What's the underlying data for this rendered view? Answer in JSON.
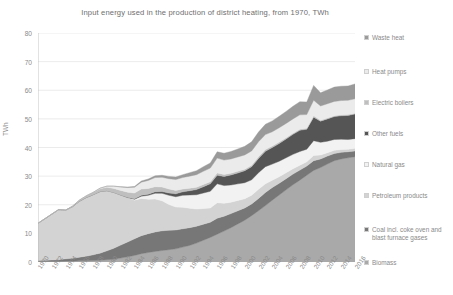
{
  "chart_data": {
    "type": "area",
    "stacked": true,
    "title": "Input energy used in the production of district heating, from 1970, TWh",
    "xlabel": "",
    "ylabel": "TWh",
    "ylim": [
      0,
      80
    ],
    "ytick_step": 10,
    "yticks": [
      0,
      10,
      20,
      30,
      40,
      50,
      60,
      70,
      80
    ],
    "grid": true,
    "grid_axis": "y",
    "legend_position": "right",
    "x_tick_labels": [
      "1970",
      "1972",
      "1974",
      "1976",
      "1978",
      "1980",
      "1982",
      "1984",
      "1986",
      "1988",
      "1990",
      "1992",
      "1994",
      "1996",
      "1998",
      "2000",
      "2002",
      "2004",
      "2006",
      "2008",
      "2010",
      "2012",
      "2014",
      "2016"
    ],
    "x": [
      1970,
      1971,
      1972,
      1973,
      1974,
      1975,
      1976,
      1977,
      1978,
      1979,
      1980,
      1981,
      1982,
      1983,
      1984,
      1985,
      1986,
      1987,
      1988,
      1989,
      1990,
      1991,
      1992,
      1993,
      1994,
      1995,
      1996,
      1997,
      1998,
      1999,
      2000,
      2001,
      2002,
      2003,
      2004,
      2005,
      2006,
      2007,
      2008,
      2009,
      2010,
      2011,
      2012,
      2013,
      2014,
      2015,
      2016
    ],
    "series": [
      {
        "name": "Biomass",
        "color": "#a9a9a9",
        "values": [
          0.2,
          0.2,
          0.2,
          0.2,
          0.3,
          0.3,
          0.4,
          0.4,
          0.5,
          0.6,
          0.8,
          1.0,
          1.4,
          1.8,
          2.3,
          2.9,
          3.3,
          3.7,
          4.0,
          4.3,
          4.6,
          5.2,
          5.8,
          6.6,
          7.6,
          8.6,
          9.7,
          10.8,
          12.0,
          13.3,
          14.6,
          16.2,
          17.9,
          19.7,
          21.6,
          23.4,
          25.2,
          27.0,
          28.6,
          30.3,
          32.0,
          33.0,
          34.2,
          35.4,
          36.0,
          36.4,
          36.8
        ]
      },
      {
        "name": "Coal incl. coke oven and blast furnace gases",
        "color": "#777777",
        "values": [
          0.3,
          0.4,
          0.5,
          0.6,
          0.8,
          1.0,
          1.3,
          1.6,
          2.0,
          2.5,
          3.1,
          3.8,
          4.5,
          5.2,
          5.8,
          6.3,
          6.6,
          6.8,
          6.9,
          6.8,
          6.6,
          6.4,
          6.2,
          5.9,
          5.6,
          5.3,
          5.6,
          5.2,
          4.9,
          4.6,
          4.3,
          4.1,
          4.3,
          4.6,
          4.4,
          4.1,
          3.9,
          3.7,
          3.5,
          3.2,
          3.4,
          3.0,
          2.8,
          2.5,
          2.3,
          2.1,
          2.0
        ]
      },
      {
        "name": "Petroleum products",
        "color": "#d3d3d3",
        "values": [
          13.0,
          14.5,
          16.0,
          17.5,
          17.0,
          18.0,
          19.5,
          20.5,
          21.0,
          21.5,
          21.0,
          19.5,
          17.5,
          15.5,
          13.5,
          13.0,
          12.0,
          11.5,
          10.5,
          9.0,
          8.0,
          7.5,
          6.8,
          6.0,
          5.5,
          5.0,
          5.4,
          4.5,
          4.0,
          3.6,
          3.2,
          3.0,
          3.2,
          3.0,
          2.6,
          2.3,
          2.1,
          1.9,
          1.7,
          1.5,
          1.8,
          1.4,
          1.2,
          1.1,
          1.0,
          0.9,
          0.9
        ]
      },
      {
        "name": "Natural gas",
        "color": "#f2f2f2",
        "values": [
          0.0,
          0.0,
          0.0,
          0.0,
          0.0,
          0.0,
          0.0,
          0.0,
          0.0,
          0.0,
          0.0,
          0.0,
          0.0,
          0.0,
          0.3,
          0.8,
          1.4,
          2.0,
          2.6,
          3.2,
          3.6,
          4.2,
          4.6,
          5.0,
          5.4,
          5.8,
          6.6,
          6.2,
          6.0,
          5.8,
          5.6,
          5.4,
          5.8,
          6.0,
          5.6,
          5.4,
          5.2,
          5.0,
          4.8,
          4.4,
          5.2,
          4.4,
          4.0,
          3.8,
          3.6,
          3.4,
          3.4
        ]
      },
      {
        "name": "Other fuels",
        "color": "#555555",
        "values": [
          0.0,
          0.0,
          0.0,
          0.0,
          0.0,
          0.0,
          0.0,
          0.0,
          0.0,
          0.0,
          0.0,
          0.0,
          0.0,
          0.1,
          0.2,
          0.3,
          0.4,
          0.5,
          0.6,
          0.8,
          1.0,
          1.2,
          1.5,
          1.8,
          2.2,
          2.6,
          3.0,
          3.2,
          3.5,
          3.8,
          4.2,
          4.6,
          5.0,
          5.4,
          5.8,
          6.2,
          6.6,
          7.0,
          7.4,
          7.0,
          8.2,
          7.4,
          7.8,
          8.0,
          8.2,
          8.4,
          8.6
        ]
      },
      {
        "name": "Electric boilers",
        "color": "#bfbfbf",
        "values": [
          0.0,
          0.0,
          0.0,
          0.0,
          0.0,
          0.2,
          0.4,
          0.6,
          0.8,
          1.0,
          1.2,
          1.4,
          1.6,
          1.8,
          2.0,
          2.2,
          2.0,
          1.8,
          1.6,
          1.4,
          1.2,
          1.0,
          0.9,
          0.8,
          0.8,
          0.7,
          0.8,
          0.7,
          0.6,
          0.6,
          0.5,
          0.5,
          0.6,
          0.6,
          0.5,
          0.5,
          0.4,
          0.4,
          0.4,
          0.3,
          0.5,
          0.3,
          0.3,
          0.3,
          0.3,
          0.3,
          0.3
        ]
      },
      {
        "name": "Heat pumps",
        "color": "#ebebeb",
        "values": [
          0.0,
          0.0,
          0.0,
          0.0,
          0.0,
          0.0,
          0.0,
          0.0,
          0.0,
          0.2,
          0.4,
          0.8,
          1.2,
          1.6,
          2.0,
          2.4,
          2.8,
          3.2,
          3.4,
          3.6,
          3.8,
          4.0,
          4.2,
          4.4,
          4.6,
          4.8,
          5.2,
          5.0,
          5.0,
          5.0,
          5.0,
          5.0,
          5.2,
          5.2,
          5.0,
          5.0,
          5.0,
          5.0,
          5.0,
          4.8,
          5.4,
          5.0,
          5.0,
          5.0,
          5.0,
          5.0,
          5.0
        ]
      },
      {
        "name": "Waste heat",
        "color": "#9a9a9a",
        "values": [
          0.0,
          0.0,
          0.0,
          0.0,
          0.0,
          0.0,
          0.0,
          0.0,
          0.0,
          0.0,
          0.0,
          0.0,
          0.1,
          0.2,
          0.3,
          0.4,
          0.5,
          0.6,
          0.7,
          0.8,
          0.9,
          1.0,
          1.2,
          1.4,
          1.6,
          1.8,
          2.2,
          2.4,
          2.6,
          2.8,
          3.0,
          3.2,
          3.4,
          3.6,
          3.8,
          4.0,
          4.2,
          4.4,
          4.6,
          4.4,
          5.2,
          4.6,
          4.8,
          5.0,
          5.0,
          5.0,
          5.2
        ]
      }
    ],
    "legend_entries": [
      {
        "label": "Waste heat",
        "color": "#9a9a9a"
      },
      {
        "label": "Heat pumps",
        "color": "#ebebeb"
      },
      {
        "label": "Electric boilers",
        "color": "#bfbfbf"
      },
      {
        "label": "Other fuels",
        "color": "#555555"
      },
      {
        "label": "Natural gas",
        "color": "#f2f2f2"
      },
      {
        "label": "Petroleum products",
        "color": "#d3d3d3"
      },
      {
        "label": "Coal incl. coke oven and blast furnace gases",
        "color": "#777777"
      },
      {
        "label": "Biomass",
        "color": "#a9a9a9"
      }
    ]
  }
}
